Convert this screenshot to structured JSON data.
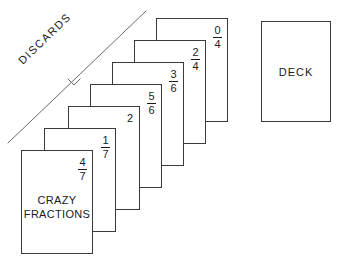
{
  "diagram": {
    "title_card": {
      "title_line1": "CRAZY",
      "title_line2": "FRACTIONS",
      "fraction": {
        "numerator": "4",
        "denominator": "7"
      }
    },
    "discards": {
      "label": "DISCARDS"
    },
    "deck": {
      "label": "DECK"
    },
    "cards": [
      {
        "id": "card-0-4",
        "numerator": "0",
        "denominator": "4"
      },
      {
        "id": "card-2-4",
        "numerator": "2",
        "denominator": "4"
      },
      {
        "id": "card-3-6",
        "numerator": "3",
        "denominator": "6"
      },
      {
        "id": "card-5-6",
        "numerator": "5",
        "denominator": "6"
      },
      {
        "id": "card-2",
        "numerator": "2",
        "denominator": ""
      },
      {
        "id": "card-1-7",
        "numerator": "1",
        "denominator": "7"
      },
      {
        "id": "card-4-7",
        "numerator": "4",
        "denominator": "7"
      }
    ],
    "colors": {
      "ink": "#1a1a1a",
      "stroke": "#3a3a3a",
      "paper": "#ffffff"
    }
  }
}
